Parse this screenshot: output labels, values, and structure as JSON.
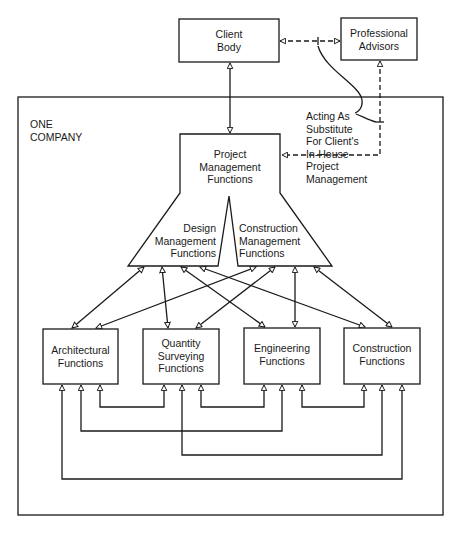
{
  "diagram": {
    "outer_frame_label": "ONE\nCOMPANY",
    "nodes": {
      "client_body": "Client\nBody",
      "professional_advisors": "Professional\nAdvisors",
      "project_management": "Project\nManagement\nFunctions",
      "design_management": "Design\nManagement\nFunctions",
      "construction_management": "Construction\nManagement\nFunctions",
      "architectural": "Architectural\nFunctions",
      "quantity_surveying": "Quantity\nSurveying\nFunctions",
      "engineering": "Engineering\nFunctions",
      "construction": "Construction\nFunctions"
    },
    "annotation": "Acting As\nSubstitute\nFor Client's\nIn-House\nProject\nManagement",
    "edges": [
      {
        "from": "client_body",
        "to": "project_management",
        "style": "solid",
        "direction": "both"
      },
      {
        "from": "client_body",
        "to": "professional_advisors",
        "style": "dashed",
        "direction": "both"
      },
      {
        "from": "professional_advisors",
        "to": "project_management",
        "style": "dashed",
        "direction": "both"
      },
      {
        "from": "design_management",
        "to": "architectural",
        "style": "solid",
        "direction": "both"
      },
      {
        "from": "design_management",
        "to": "quantity_surveying",
        "style": "solid",
        "direction": "both"
      },
      {
        "from": "design_management",
        "to": "engineering",
        "style": "solid",
        "direction": "both"
      },
      {
        "from": "design_management",
        "to": "construction",
        "style": "solid",
        "direction": "both"
      },
      {
        "from": "construction_management",
        "to": "architectural",
        "style": "solid",
        "direction": "both"
      },
      {
        "from": "construction_management",
        "to": "quantity_surveying",
        "style": "solid",
        "direction": "both"
      },
      {
        "from": "construction_management",
        "to": "engineering",
        "style": "solid",
        "direction": "both"
      },
      {
        "from": "construction_management",
        "to": "construction",
        "style": "solid",
        "direction": "both"
      },
      {
        "from": "architectural",
        "to": "quantity_surveying",
        "style": "solid",
        "direction": "both"
      },
      {
        "from": "quantity_surveying",
        "to": "engineering",
        "style": "solid",
        "direction": "both"
      },
      {
        "from": "engineering",
        "to": "construction",
        "style": "solid",
        "direction": "both"
      },
      {
        "from": "architectural",
        "to": "engineering",
        "style": "solid",
        "direction": "both"
      },
      {
        "from": "quantity_surveying",
        "to": "construction",
        "style": "solid",
        "direction": "both"
      },
      {
        "from": "architectural",
        "to": "construction",
        "style": "solid",
        "direction": "both"
      }
    ],
    "colors": {
      "stroke": "#1a1a1a",
      "background": "#ffffff"
    }
  }
}
